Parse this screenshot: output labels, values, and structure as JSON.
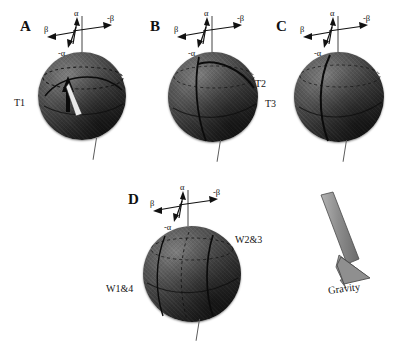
{
  "figure": {
    "background": "#ffffff",
    "sphere_color_light": "#7e7e7e",
    "sphere_color_dark": "#101010",
    "line_color": "#111111"
  },
  "axis_labels": {
    "alpha": "α",
    "neg_alpha": "-α",
    "beta": "β",
    "neg_beta": "-β"
  },
  "panels": [
    {
      "letter": "A",
      "sphere_label": "T1",
      "has_pointer_arrow": true,
      "meridian_style": "solid-plus-dashed"
    },
    {
      "letter": "B",
      "sphere_label": "T2",
      "has_pointer_arrow": false,
      "meridian_style": "solid-plus-dashed"
    },
    {
      "letter": "C",
      "sphere_label": "T3",
      "has_pointer_arrow": false,
      "meridian_style": "solid-plus-dashed"
    },
    {
      "letter": "D",
      "sphere_label_right": "W2&3",
      "sphere_label_left": "W1&4",
      "has_pointer_arrow": false,
      "meridian_style": "multi-meridian"
    }
  ],
  "gravity": {
    "label": "Gravity",
    "arrow_direction": "down-right",
    "arrow_color": "#8a8a8a"
  }
}
